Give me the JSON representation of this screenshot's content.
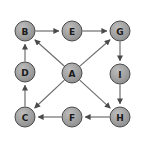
{
  "diagram": {
    "type": "directed-graph",
    "title": "",
    "canvas": {
      "width": 145,
      "height": 145,
      "background": "#ffffff",
      "border_color": "#d8d8d8"
    },
    "style": {
      "node_fill": "#9a9a9a",
      "node_fill_highlight": "#b4b4b4",
      "node_stroke": "#4a4a4a",
      "node_radius": 10,
      "label_color": "#1a1a1a",
      "edge_color": "#6e6e6e",
      "edge_width": 1.2,
      "arrow_color": "#4a4a4a"
    },
    "nodes": [
      {
        "id": "B",
        "label": "B",
        "x": 25,
        "y": 31
      },
      {
        "id": "E",
        "label": "E",
        "x": 72,
        "y": 31
      },
      {
        "id": "G",
        "label": "G",
        "x": 120,
        "y": 31
      },
      {
        "id": "D",
        "label": "D",
        "x": 25,
        "y": 72
      },
      {
        "id": "A",
        "label": "A",
        "x": 72,
        "y": 73
      },
      {
        "id": "I",
        "label": "I",
        "x": 120,
        "y": 74
      },
      {
        "id": "C",
        "label": "C",
        "x": 25,
        "y": 117
      },
      {
        "id": "F",
        "label": "F",
        "x": 72,
        "y": 117
      },
      {
        "id": "H",
        "label": "H",
        "x": 120,
        "y": 117
      }
    ],
    "edges": [
      {
        "from": "B",
        "to": "E",
        "label": ""
      },
      {
        "from": "E",
        "to": "G",
        "label": ""
      },
      {
        "from": "G",
        "to": "I",
        "label": ""
      },
      {
        "from": "I",
        "to": "H",
        "label": ""
      },
      {
        "from": "H",
        "to": "F",
        "label": ""
      },
      {
        "from": "F",
        "to": "C",
        "label": ""
      },
      {
        "from": "C",
        "to": "D",
        "label": ""
      },
      {
        "from": "D",
        "to": "B",
        "label": ""
      },
      {
        "from": "A",
        "to": "B",
        "label": ""
      },
      {
        "from": "A",
        "to": "G",
        "label": ""
      },
      {
        "from": "A",
        "to": "C",
        "label": ""
      },
      {
        "from": "A",
        "to": "H",
        "label": ""
      }
    ]
  }
}
